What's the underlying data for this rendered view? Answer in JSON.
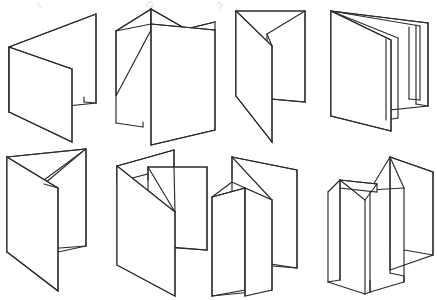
{
  "document": {
    "title": "Paper Fold Types Diagram",
    "background_color": "#ffffff",
    "line_color": "#2b2b2b",
    "face_color": "#ffffff",
    "width": 437,
    "height": 300,
    "style": "line-art perspective drawing, no labels visible"
  },
  "layout": {
    "rows": 2,
    "columns": 4,
    "total_figures": 8,
    "row_labels": [
      "top-row",
      "bottom-row"
    ]
  },
  "figures": [
    {
      "id": "fold-1",
      "position": "row1-col1",
      "name": "half-fold",
      "panels": 2,
      "description": "Single center fold shown standing open like a tent viewed from the front-left; two panels meeting at a vertical spine.",
      "orientation": "open-V",
      "outline_points": "10,48 96,14 96,104 14,132"
    },
    {
      "id": "fold-2",
      "position": "row1-col2",
      "name": "accordion-fold",
      "panels": 3,
      "description": "Z / accordion fold standing upright, zig-zag top edge with three panels alternating forward and back.",
      "orientation": "zig-zag",
      "outline_points": "117,32 152,10 185,30 215,22"
    },
    {
      "id": "fold-3",
      "position": "row1-col3",
      "name": "gate-fold-open",
      "panels": 3,
      "description": "Gate fold with a tall back panel and a narrow inner flap folded inward at the top-left.",
      "orientation": "open-gate",
      "outline_points": "236,12 304,12 304,104 232,98"
    },
    {
      "id": "fold-4",
      "position": "row1-col4",
      "name": "roll-fold",
      "panels": 4,
      "description": "Roll fold / four panel wrap, panels nested one inside the next with stepped bottom edges.",
      "orientation": "nested-roll",
      "outline_points": "332,12 430,22 430,108 334,134"
    },
    {
      "id": "fold-5",
      "position": "row2-col1",
      "name": "half-fold-reversed",
      "panels": 2,
      "description": "Two-panel fold opened the opposite way, with a thin folded lip visible along the upper right edge.",
      "orientation": "open-V-reversed",
      "outline_points": "8,158 86,150 86,248 10,278"
    },
    {
      "id": "fold-6",
      "position": "row2-col2",
      "name": "letter-fold",
      "panels": 3,
      "description": "Letter / tri fold standing upright; diagonal creases radiate from the central spine to the left and right panels.",
      "orientation": "tri-fold",
      "orientation_detail": "C-fold"
    },
    {
      "id": "fold-7",
      "position": "row2-col3",
      "name": "double-parallel-fold",
      "panels": 4,
      "description": "Double parallel fold; a wide back panel with a small triangular inner flap tucked at the left of the spine.",
      "orientation": "parallel"
    },
    {
      "id": "fold-8",
      "position": "row2-col4",
      "name": "gate-fold-closed",
      "panels": 4,
      "description": "Gate fold shown standing with two outer wings folding in toward a central double spine, viewed from above.",
      "orientation": "gate"
    }
  ],
  "artifacts": {
    "present": true,
    "description": "Faint cropped marks along the very top edge of the image, remnants of a trimmed caption row."
  }
}
